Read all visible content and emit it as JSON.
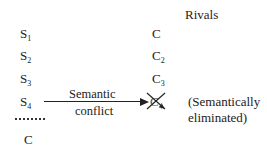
{
  "header": {
    "rivals_label": "Rivals"
  },
  "left_column": {
    "items": [
      {
        "base": "S",
        "sub": "1"
      },
      {
        "base": "S",
        "sub": "2"
      },
      {
        "base": "S",
        "sub": "3"
      },
      {
        "base": "S",
        "sub": "4"
      }
    ],
    "conclusion": "C"
  },
  "right_column": {
    "items": [
      {
        "base": "C",
        "sub": ""
      },
      {
        "base": "C",
        "sub": "2"
      },
      {
        "base": "C",
        "sub": "3"
      },
      {
        "base": "C",
        "sub": "4",
        "crossed_out": true
      }
    ]
  },
  "arrow": {
    "label_top": "Semantic",
    "label_bottom": "conflict"
  },
  "annotation": {
    "line1": "(Semantically",
    "line2": "eliminated)"
  }
}
